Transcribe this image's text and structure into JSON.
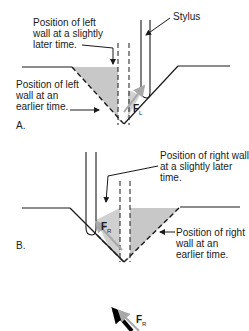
{
  "figure": {
    "panel_a": {
      "label": "A.",
      "annotations": {
        "stylus": "Stylus",
        "left_wall_later": "Position of left\nwall at a slightly\nlater time.",
        "left_wall_earlier": "Position of left\nwall at an\nearlier time."
      },
      "force_label": "F",
      "force_subscript": "L"
    },
    "panel_b": {
      "label": "B.",
      "annotations": {
        "right_wall_later": "Position of right wall\nat a slightly later\ntime.",
        "right_wall_earlier": "Position of right\nwall at an\nearlier time."
      },
      "force_label": "F",
      "force_subscript": "R"
    },
    "resultant": {
      "force_label": "F",
      "force_subscript": "R"
    },
    "colors": {
      "groove_fill": "#c8c8c8",
      "line": "#1a1a1a",
      "force_arrow": "#a8a8a8",
      "resultant_arrow": "#000000"
    }
  }
}
